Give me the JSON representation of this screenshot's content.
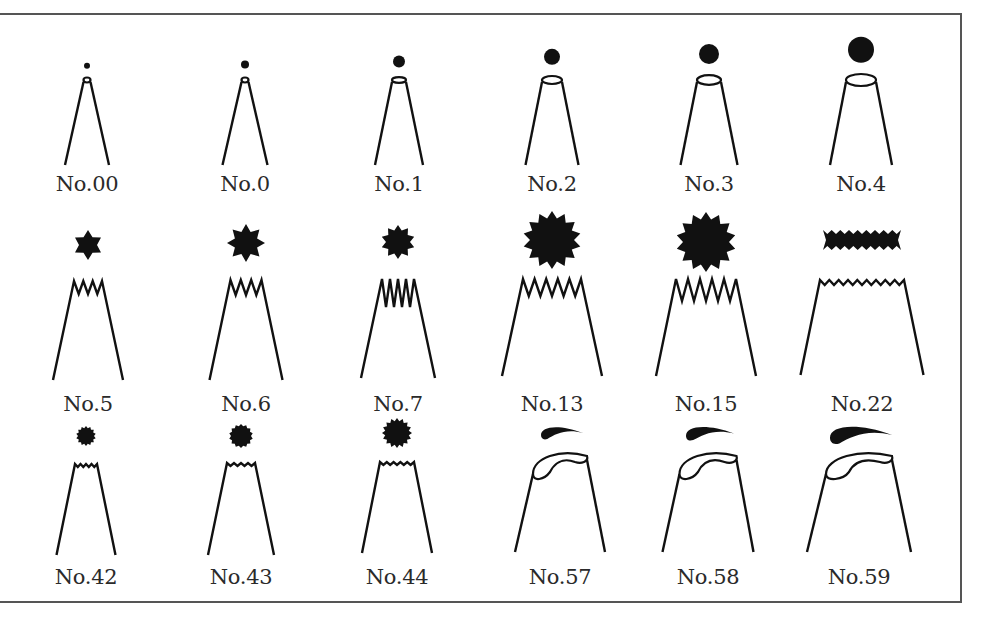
{
  "diagram": {
    "colors": {
      "ink": "#111111",
      "label": "#2a2a2a",
      "frame": "#555555",
      "background": "#ffffff"
    },
    "rows": [
      {
        "type": "round",
        "tips": [
          {
            "label": "No.00",
            "cx": 87,
            "icing_r": 3,
            "top_w": 7,
            "bottom_w": 44,
            "top_y": 80,
            "bottom_y": 165,
            "label_y": 172
          },
          {
            "label": "No.0",
            "cx": 245,
            "icing_r": 4,
            "top_w": 7,
            "bottom_w": 45,
            "top_y": 80,
            "bottom_y": 165,
            "label_y": 172
          },
          {
            "label": "No.1",
            "cx": 399,
            "icing_r": 6,
            "top_w": 14,
            "bottom_w": 48,
            "top_y": 80,
            "bottom_y": 165,
            "label_y": 172
          },
          {
            "label": "No.2",
            "cx": 552,
            "icing_r": 8,
            "top_w": 20,
            "bottom_w": 53,
            "top_y": 80,
            "bottom_y": 165,
            "label_y": 172
          },
          {
            "label": "No.3",
            "cx": 709,
            "icing_r": 10,
            "top_w": 24,
            "bottom_w": 57,
            "top_y": 80,
            "bottom_y": 165,
            "label_y": 172
          },
          {
            "label": "No.4",
            "cx": 861,
            "icing_r": 13,
            "top_w": 30,
            "bottom_w": 62,
            "top_y": 80,
            "bottom_y": 165,
            "label_y": 172
          }
        ]
      },
      {
        "type": "star",
        "tips": [
          {
            "label": "No.5",
            "cx": 88,
            "icing_cy": 245,
            "points": 6,
            "outer_r": 15,
            "inner_r": 9,
            "teeth": 3,
            "tooth_h": 13,
            "top_w": 28,
            "bottom_w": 70,
            "top_y": 281,
            "bottom_y": 380,
            "label_y": 392
          },
          {
            "label": "No.6",
            "cx": 246,
            "icing_cy": 243,
            "points": 8,
            "outer_r": 19,
            "inner_r": 12,
            "teeth": 3,
            "tooth_h": 15,
            "top_w": 31,
            "bottom_w": 73,
            "top_y": 280,
            "bottom_y": 380,
            "label_y": 392
          },
          {
            "label": "No.7",
            "cx": 398,
            "icing_cy": 242,
            "points": 10,
            "outer_r": 17,
            "inner_r": 12,
            "teeth": 4,
            "tooth_h": 28,
            "top_w": 32,
            "bottom_w": 74,
            "top_y": 279,
            "bottom_y": 378,
            "label_y": 392
          },
          {
            "label": "No.13",
            "cx": 552,
            "icing_cy": 240,
            "points": 14,
            "outer_r": 29,
            "inner_r": 22,
            "teeth": 5,
            "tooth_h": 17,
            "top_w": 58,
            "bottom_w": 100,
            "top_y": 279,
            "bottom_y": 376,
            "label_y": 392
          },
          {
            "label": "No.15",
            "cx": 706,
            "icing_cy": 242,
            "points": 14,
            "outer_r": 30,
            "inner_r": 23,
            "teeth": 5,
            "tooth_h": 22,
            "top_w": 60,
            "bottom_w": 100,
            "top_y": 279,
            "bottom_y": 376,
            "label_y": 392
          },
          {
            "label": "No.22",
            "cx": 862,
            "icing_cy": 240,
            "ribbon_w": 78,
            "ribbon_h": 20,
            "ribbon_teeth": 9,
            "teeth": 9,
            "tooth_h": 5,
            "top_w": 84,
            "bottom_w": 123,
            "top_y": 280,
            "bottom_y": 375,
            "label_y": 392
          }
        ]
      },
      {
        "type": "fine-star",
        "tips": [
          {
            "label": "No.42",
            "cx": 86,
            "icing_cy": 436,
            "points": 14,
            "outer_r": 10,
            "inner_r": 8,
            "teeth": 4,
            "tooth_h": 3,
            "top_w": 22,
            "bottom_w": 59,
            "top_y": 464,
            "bottom_y": 555,
            "label_y": 565
          },
          {
            "label": "No.43",
            "cx": 241,
            "icing_cy": 436,
            "points": 14,
            "outer_r": 12,
            "inner_r": 10,
            "teeth": 4,
            "tooth_h": 3,
            "top_w": 28,
            "bottom_w": 66,
            "top_y": 463,
            "bottom_y": 555,
            "label_y": 565
          },
          {
            "label": "No.44",
            "cx": 397,
            "icing_cy": 433,
            "points": 16,
            "outer_r": 15,
            "inner_r": 12,
            "teeth": 5,
            "tooth_h": 3,
            "top_w": 34,
            "bottom_w": 70,
            "top_y": 462,
            "bottom_y": 553,
            "label_y": 565
          }
        ]
      },
      {
        "type": "petal",
        "tips": [
          {
            "label": "No.57",
            "cx": 560,
            "icing_w": 42,
            "icing_h": 10,
            "top_w": 54,
            "bottom_w": 90,
            "top_y": 460,
            "bottom_y": 552,
            "label_y": 565
          },
          {
            "label": "No.58",
            "cx": 708,
            "icing_w": 48,
            "icing_h": 11,
            "top_w": 57,
            "bottom_w": 91,
            "top_y": 460,
            "bottom_y": 552,
            "label_y": 565
          },
          {
            "label": "No.59",
            "cx": 859,
            "icing_w": 62,
            "icing_h": 14,
            "top_w": 66,
            "bottom_w": 104,
            "top_y": 460,
            "bottom_y": 552,
            "label_y": 565
          }
        ]
      }
    ]
  }
}
